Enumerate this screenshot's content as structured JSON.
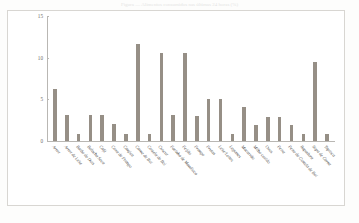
{
  "top_caption": "Figura — Alimentos consumidos nas últimas 24 horas (%)",
  "axis": {
    "y_title": "Alimentos Consumidos nas últimas\n24h (%)",
    "y_ticks": [
      "0",
      "5",
      "10",
      "15"
    ]
  },
  "colors": {
    "bar": "#8d867c",
    "axis": "#b9b7b3",
    "text": "#4f4d4a",
    "frame": "#d8d6d2",
    "background": "#ffffff"
  },
  "chart_data": {
    "type": "bar",
    "title": "",
    "xlabel": "",
    "ylabel": "Alimentos Consumidos nas últimas 24h (%)",
    "ylim": [
      0,
      15
    ],
    "yticks": [
      0,
      5,
      10,
      15
    ],
    "grid": false,
    "legend": "none",
    "categories": [
      "Arroz",
      "Arroz de Leite",
      "Baião de Dois",
      "Bolacha Seca",
      "Café",
      "Coxa de Frango",
      "Canjica",
      "Carne de Boi",
      "Costela de Boi",
      "Cuscuz",
      "Farinha de Mandioca",
      "Feijão",
      "Frango",
      "Frutas",
      "Leite/Leites",
      "Legumes",
      "Macarrão",
      "Milho cozido",
      "Ovos",
      "Peixe",
      "Peito de Costela de Boi",
      "Rapadura",
      "Sopa de Carne",
      "Tapioca"
    ],
    "values": [
      6.2,
      3.1,
      0.9,
      3.1,
      3.1,
      2.0,
      0.9,
      11.7,
      0.9,
      10.6,
      3.1,
      10.6,
      3.0,
      5.1,
      5.1,
      0.9,
      4.1,
      1.9,
      2.9,
      2.9,
      1.9,
      0.8,
      9.5,
      0.8
    ]
  }
}
